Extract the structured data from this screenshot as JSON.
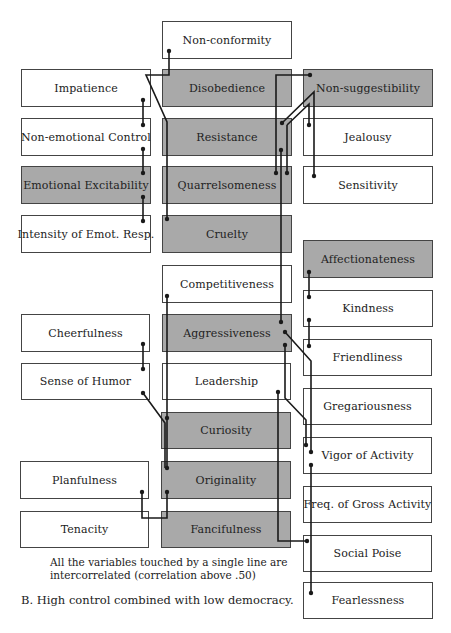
{
  "diagram": {
    "boxes": [
      {
        "id": "non-conformity",
        "label": "Non-conformity",
        "shaded": false
      },
      {
        "id": "impatience",
        "label": "Impatience",
        "shaded": false
      },
      {
        "id": "disobedience",
        "label": "Disobedience",
        "shaded": true
      },
      {
        "id": "non-suggestibility",
        "label": "Non-suggestibility",
        "shaded": true
      },
      {
        "id": "non-emotional-control",
        "label": "Non-emotional Control",
        "shaded": false
      },
      {
        "id": "resistance",
        "label": "Resistance",
        "shaded": true
      },
      {
        "id": "jealousy",
        "label": "Jealousy",
        "shaded": false
      },
      {
        "id": "emotional-excitability",
        "label": "Emotional Excitability",
        "shaded": true
      },
      {
        "id": "quarrelsomeness",
        "label": "Quarrelsomeness",
        "shaded": true
      },
      {
        "id": "sensitivity",
        "label": "Sensitivity",
        "shaded": false
      },
      {
        "id": "intensity-of-emot-resp",
        "label": "Intensity of Emot. Resp.",
        "shaded": false
      },
      {
        "id": "cruelty",
        "label": "Cruelty",
        "shaded": true
      },
      {
        "id": "affectionateness",
        "label": "Affectionateness",
        "shaded": true
      },
      {
        "id": "competitiveness",
        "label": "Competitiveness",
        "shaded": false
      },
      {
        "id": "kindness",
        "label": "Kindness",
        "shaded": false
      },
      {
        "id": "cheerfulness",
        "label": "Cheerfulness",
        "shaded": false
      },
      {
        "id": "aggressiveness",
        "label": "Aggressiveness",
        "shaded": true
      },
      {
        "id": "friendliness",
        "label": "Friendliness",
        "shaded": false
      },
      {
        "id": "sense-of-humor",
        "label": "Sense of Humor",
        "shaded": false
      },
      {
        "id": "leadership",
        "label": "Leadership",
        "shaded": false
      },
      {
        "id": "gregariousness",
        "label": "Gregariousness",
        "shaded": false
      },
      {
        "id": "curiosity",
        "label": "Curiosity",
        "shaded": true
      },
      {
        "id": "vigor-of-activity",
        "label": "Vigor of Activity",
        "shaded": false
      },
      {
        "id": "planfulness",
        "label": "Planfulness",
        "shaded": false
      },
      {
        "id": "originality",
        "label": "Originality",
        "shaded": true
      },
      {
        "id": "freq-of-gross-activity",
        "label": "Freq. of Gross Activity",
        "shaded": false
      },
      {
        "id": "tenacity",
        "label": "Tenacity",
        "shaded": false
      },
      {
        "id": "fancifulness",
        "label": "Fancifulness",
        "shaded": true
      },
      {
        "id": "social-poise",
        "label": "Social Poise",
        "shaded": false
      },
      {
        "id": "fearlessness",
        "label": "Fearlessness",
        "shaded": false
      }
    ],
    "note_line1": "All the variables touched by a single line are",
    "note_line2": "intercorrelated (correlation above .50)",
    "caption": "B.  High control combined with low democracy.",
    "colors": {
      "shaded": "#a9a9a9",
      "line": "#1a1a1a",
      "border": "#444444"
    }
  }
}
